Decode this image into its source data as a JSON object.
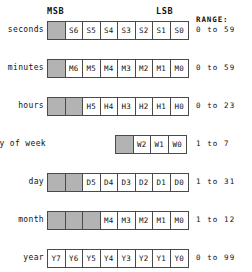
{
  "header": {
    "msb_label": "MSB",
    "lsb_label": "LSB",
    "range_label": "RANGE:"
  },
  "colors": {
    "unused_cell": "#b3b3b3",
    "used_cell": "#ffffff",
    "border": "#4a4a4a",
    "text": "#111111",
    "background": "#ffffff"
  },
  "bit_width": 8,
  "rows": [
    {
      "label": "seconds",
      "range": "0 to 59",
      "unused_bits": 1,
      "bits": [
        "S6",
        "S5",
        "S4",
        "S3",
        "S2",
        "S1",
        "S0"
      ],
      "right_aligned": false
    },
    {
      "label": "minutes",
      "range": "0 to 59",
      "unused_bits": 1,
      "bits": [
        "M6",
        "M5",
        "M4",
        "M3",
        "M2",
        "M1",
        "M0"
      ],
      "right_aligned": false
    },
    {
      "label": "hours",
      "range": "0 to 23",
      "unused_bits": 2,
      "bits": [
        "H5",
        "H4",
        "H3",
        "H2",
        "H1",
        "H0"
      ],
      "right_aligned": false
    },
    {
      "label": "day of week",
      "range": "1 to 7",
      "unused_bits": 1,
      "bits": [
        "W2",
        "W1",
        "W0"
      ],
      "right_aligned": true
    },
    {
      "label": "day",
      "range": "1 to 31",
      "unused_bits": 2,
      "bits": [
        "D5",
        "D4",
        "D3",
        "D2",
        "D1",
        "D0"
      ],
      "right_aligned": false
    },
    {
      "label": "month",
      "range": "1 to 12",
      "unused_bits": 3,
      "bits": [
        "M4",
        "M3",
        "M2",
        "M1",
        "M0"
      ],
      "right_aligned": false
    },
    {
      "label": "year",
      "range": "0 to 99",
      "unused_bits": 0,
      "bits": [
        "Y7",
        "Y6",
        "Y5",
        "Y4",
        "Y3",
        "Y2",
        "Y1",
        "Y0"
      ],
      "right_aligned": false
    }
  ]
}
